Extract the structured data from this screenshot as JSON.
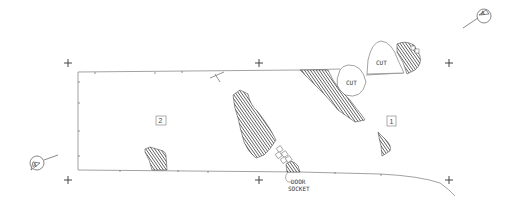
{
  "drawing": {
    "type": "archaeological site plan",
    "areas": [
      {
        "id": "area-1",
        "label": "1"
      },
      {
        "id": "area-2",
        "label": "2"
      }
    ],
    "cut_labels": [
      "CUT",
      "CUT"
    ],
    "annotations": {
      "door_socket_line1": "DOOR",
      "door_socket_line2": "SOCKET"
    },
    "section_markers": [
      {
        "id": "section-a-top-right",
        "label": "A"
      },
      {
        "id": "section-a-bottom-left",
        "label": "A"
      }
    ],
    "grid_crosses": 6,
    "colors": {
      "line": "#8a8a8a",
      "hatch": "#444444",
      "background": "#ffffff"
    }
  }
}
